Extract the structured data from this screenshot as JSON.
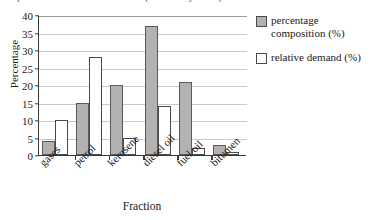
{
  "caption_sliver": "composition and relative demand for the major oil fractions",
  "chart_data": {
    "type": "bar",
    "title": "",
    "xlabel": "Fraction",
    "ylabel": "Percentage",
    "ylim": [
      0,
      40
    ],
    "yticks": [
      "0",
      "5",
      "10",
      "15",
      "20",
      "25",
      "30",
      "35",
      "40"
    ],
    "grid": true,
    "legend_position": "right",
    "categories": [
      "gases",
      "petrol",
      "kerosene",
      "diesel oil",
      "fuel oil",
      "bitumen"
    ],
    "series": [
      {
        "name": "percentage composition (%)",
        "color": "#b2b2b2",
        "values": [
          4,
          15,
          20,
          37,
          21,
          3
        ]
      },
      {
        "name": "relative demand (%)",
        "color": "#ffffff",
        "values": [
          10,
          28,
          5,
          14,
          2,
          1
        ]
      }
    ]
  },
  "legend": {
    "items": [
      {
        "label": "percentage composition (%)",
        "swatch": "gray"
      },
      {
        "label": "relative demand (%)",
        "swatch": "white"
      }
    ]
  }
}
